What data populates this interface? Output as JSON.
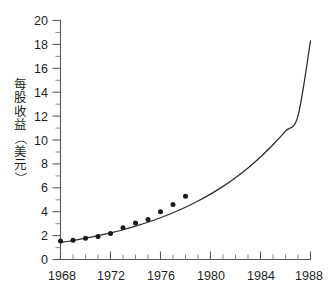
{
  "chart_data": {
    "type": "scatter",
    "title": "",
    "xlabel": "",
    "ylabel": "每股收益（美元）",
    "xlim": [
      1968,
      1988
    ],
    "ylim": [
      0,
      20
    ],
    "grid": false,
    "legend": "none",
    "x_major_ticks": [
      1968,
      1972,
      1976,
      1980,
      1984,
      1988
    ],
    "x_major_tick_labels": [
      "1968",
      "1972",
      "1976",
      "1980",
      "1984",
      "1988"
    ],
    "x_minor_tick_step": 1,
    "y_major_ticks": [
      0,
      2,
      4,
      6,
      8,
      10,
      12,
      14,
      16,
      18,
      20
    ],
    "y_major_tick_labels": [
      "0",
      "2",
      "4",
      "6",
      "8",
      "10",
      "12",
      "14",
      "16",
      "18",
      "20"
    ],
    "y_minor_tick_step": 1,
    "series": [
      {
        "name": "观测数据点",
        "type": "scatter",
        "marker": "filled-circle",
        "color": "#1a1a1a",
        "x": [
          1968,
          1969,
          1970,
          1971,
          1972,
          1973,
          1974,
          1975,
          1976,
          1977,
          1978
        ],
        "values": [
          1.55,
          1.62,
          1.78,
          1.92,
          2.18,
          2.66,
          3.05,
          3.35,
          4.0,
          4.6,
          5.3
        ]
      },
      {
        "name": "指数拟合曲线",
        "type": "line",
        "color": "#2b2b2b",
        "x": [
          1968,
          1969,
          1970,
          1971,
          1972,
          1973,
          1974,
          1975,
          1976,
          1977,
          1978,
          1979,
          1980,
          1981,
          1982,
          1983,
          1984,
          1985,
          1986,
          1987,
          1988
        ],
        "values": [
          1.42,
          1.59,
          1.78,
          1.99,
          2.23,
          2.49,
          2.79,
          3.12,
          3.49,
          3.91,
          4.37,
          4.89,
          5.47,
          6.12,
          6.85,
          7.66,
          8.58,
          9.6,
          10.74,
          12.02,
          18.3
        ]
      }
    ],
    "ylabel_chars": [
      "每",
      "股",
      "收",
      "益",
      "（",
      "美",
      "元",
      "）"
    ]
  },
  "axis": {
    "y_label_full": "每股收益（美元）"
  }
}
